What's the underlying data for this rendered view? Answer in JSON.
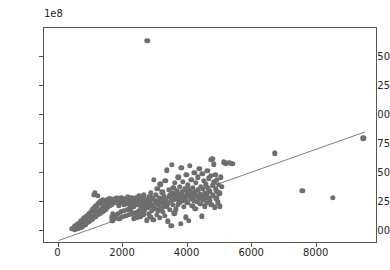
{
  "figure": {
    "width": 390,
    "height": 270,
    "background": "#ffffff",
    "marker_color": "#6e6e6e",
    "line_color": "#707070",
    "axis_color": "#555555",
    "text_color": "#262626"
  },
  "axes": {
    "left": 43,
    "top": 27,
    "width": 334,
    "height": 216,
    "offset_text": "1e8"
  },
  "chart_data": {
    "type": "scatter",
    "title": "",
    "xlabel": "",
    "ylabel": "",
    "y_offset_label": "1e8",
    "y_offset_multiplier": 100000000,
    "xlim": [
      -450,
      9900
    ],
    "ylim": [
      -11000000,
      175000000
    ],
    "grid": false,
    "legend": null,
    "xticks": [
      0,
      2000,
      4000,
      6000,
      8000
    ],
    "xticklabels": [
      "0",
      "2000",
      "4000",
      "6000",
      "8000"
    ],
    "yticks": [
      0,
      25000000,
      50000000,
      75000000,
      100000000,
      125000000,
      150000000
    ],
    "yticklabels": [
      "0.00",
      "0.25",
      "0.50",
      "0.75",
      "1.00",
      "1.25",
      "1.50"
    ],
    "series": [
      {
        "name": "observations",
        "type": "scatter",
        "color": "#6e6e6e",
        "marker": "o",
        "marker_size": 5.4,
        "points": [
          [
            430,
            2100000
          ],
          [
            470,
            3200000
          ],
          [
            500,
            1500000
          ],
          [
            520,
            4300000
          ],
          [
            545,
            2600000
          ],
          [
            560,
            5500000
          ],
          [
            575,
            3400000
          ],
          [
            600,
            1900000
          ],
          [
            615,
            6100000
          ],
          [
            630,
            4000000
          ],
          [
            650,
            2800000
          ],
          [
            665,
            7300000
          ],
          [
            680,
            5000000
          ],
          [
            695,
            3300000
          ],
          [
            710,
            8600000
          ],
          [
            725,
            6200000
          ],
          [
            740,
            4400000
          ],
          [
            755,
            9500000
          ],
          [
            770,
            7000000
          ],
          [
            785,
            5300000
          ],
          [
            800,
            11000000
          ],
          [
            815,
            8200000
          ],
          [
            830,
            6000000
          ],
          [
            845,
            12500000
          ],
          [
            860,
            9000000
          ],
          [
            875,
            7400000
          ],
          [
            890,
            13500000
          ],
          [
            905,
            10500000
          ],
          [
            920,
            8000000
          ],
          [
            935,
            14500000
          ],
          [
            950,
            11500000
          ],
          [
            965,
            9200000
          ],
          [
            980,
            16000000
          ],
          [
            995,
            12000000
          ],
          [
            1010,
            10000000
          ],
          [
            1025,
            17500000
          ],
          [
            1040,
            13200000
          ],
          [
            1055,
            11000000
          ],
          [
            1070,
            19000000
          ],
          [
            1085,
            14000000
          ],
          [
            1100,
            12500000
          ],
          [
            1110,
            31500000
          ],
          [
            1120,
            33000000
          ],
          [
            1130,
            20500000
          ],
          [
            1145,
            15500000
          ],
          [
            1160,
            13000000
          ],
          [
            1175,
            22000000
          ],
          [
            1190,
            16500000
          ],
          [
            1205,
            14000000
          ],
          [
            1220,
            30500000
          ],
          [
            1235,
            23500000
          ],
          [
            1250,
            17500000
          ],
          [
            1265,
            15000000
          ],
          [
            1280,
            25000000
          ],
          [
            1295,
            18500000
          ],
          [
            1310,
            16000000
          ],
          [
            1325,
            26000000
          ],
          [
            1340,
            19500000
          ],
          [
            1355,
            17000000
          ],
          [
            1370,
            27000000
          ],
          [
            1385,
            20500000
          ],
          [
            1400,
            18000000
          ],
          [
            1415,
            24000000
          ],
          [
            1430,
            21500000
          ],
          [
            1445,
            19000000
          ],
          [
            1460,
            25500000
          ],
          [
            1475,
            22500000
          ],
          [
            1490,
            20000000
          ],
          [
            1505,
            26500000
          ],
          [
            1520,
            23000000
          ],
          [
            1535,
            21000000
          ],
          [
            1550,
            27500000
          ],
          [
            1565,
            24000000
          ],
          [
            1580,
            22000000
          ],
          [
            1600,
            28000000
          ],
          [
            1615,
            25000000
          ],
          [
            1630,
            23000000
          ],
          [
            1650,
            12000000
          ],
          [
            1665,
            9000000
          ],
          [
            1680,
            14500000
          ],
          [
            1700,
            26500000
          ],
          [
            1715,
            24500000
          ],
          [
            1730,
            11500000
          ],
          [
            1750,
            27500000
          ],
          [
            1765,
            25500000
          ],
          [
            1780,
            13500000
          ],
          [
            1800,
            28500000
          ],
          [
            1815,
            26000000
          ],
          [
            1830,
            15000000
          ],
          [
            1850,
            24000000
          ],
          [
            1865,
            22000000
          ],
          [
            1880,
            10500000
          ],
          [
            1900,
            27000000
          ],
          [
            1915,
            25000000
          ],
          [
            1930,
            16500000
          ],
          [
            1950,
            29000000
          ],
          [
            1965,
            26500000
          ],
          [
            1980,
            12500000
          ],
          [
            2000,
            24500000
          ],
          [
            2015,
            22500000
          ],
          [
            2030,
            17500000
          ],
          [
            2050,
            28000000
          ],
          [
            2065,
            25500000
          ],
          [
            2080,
            13500000
          ],
          [
            2100,
            26000000
          ],
          [
            2115,
            23500000
          ],
          [
            2130,
            18500000
          ],
          [
            2150,
            29500000
          ],
          [
            2165,
            27000000
          ],
          [
            2180,
            14000000
          ],
          [
            2200,
            25000000
          ],
          [
            2215,
            22000000
          ],
          [
            2230,
            19500000
          ],
          [
            2250,
            28500000
          ],
          [
            2265,
            26000000
          ],
          [
            2280,
            15500000
          ],
          [
            2300,
            24000000
          ],
          [
            2315,
            21000000
          ],
          [
            2330,
            11000000
          ],
          [
            2350,
            27500000
          ],
          [
            2365,
            25000000
          ],
          [
            2380,
            16000000
          ],
          [
            2400,
            29000000
          ],
          [
            2415,
            23000000
          ],
          [
            2430,
            12000000
          ],
          [
            2450,
            26500000
          ],
          [
            2465,
            22500000
          ],
          [
            2480,
            17000000
          ],
          [
            2500,
            30000000
          ],
          [
            2515,
            24500000
          ],
          [
            2530,
            13000000
          ],
          [
            2550,
            28000000
          ],
          [
            2565,
            21500000
          ],
          [
            2580,
            18000000
          ],
          [
            2600,
            25500000
          ],
          [
            2615,
            23500000
          ],
          [
            2630,
            14500000
          ],
          [
            2650,
            31000000
          ],
          [
            2665,
            26500000
          ],
          [
            2680,
            19000000
          ],
          [
            2700,
            24000000
          ],
          [
            2715,
            22000000
          ],
          [
            2730,
            9500000
          ],
          [
            2750,
            164000000
          ],
          [
            2760,
            27000000
          ],
          [
            2775,
            20500000
          ],
          [
            2790,
            15000000
          ],
          [
            2810,
            29500000
          ],
          [
            2825,
            25000000
          ],
          [
            2840,
            12500000
          ],
          [
            2860,
            33000000
          ],
          [
            2875,
            23000000
          ],
          [
            2890,
            17500000
          ],
          [
            2910,
            28500000
          ],
          [
            2925,
            21000000
          ],
          [
            2940,
            10000000
          ],
          [
            2960,
            44500000
          ],
          [
            2975,
            26000000
          ],
          [
            2990,
            19500000
          ],
          [
            3010,
            31500000
          ],
          [
            3025,
            24500000
          ],
          [
            3040,
            14000000
          ],
          [
            3060,
            36500000
          ],
          [
            3075,
            22500000
          ],
          [
            3090,
            18000000
          ],
          [
            3110,
            29000000
          ],
          [
            3125,
            25500000
          ],
          [
            3140,
            11500000
          ],
          [
            3160,
            40500000
          ],
          [
            3175,
            27500000
          ],
          [
            3190,
            20000000
          ],
          [
            3210,
            33500000
          ],
          [
            3225,
            23500000
          ],
          [
            3240,
            16500000
          ],
          [
            3260,
            30500000
          ],
          [
            3275,
            26500000
          ],
          [
            3290,
            13500000
          ],
          [
            3310,
            43500000
          ],
          [
            3325,
            28000000
          ],
          [
            3340,
            21500000
          ],
          [
            3360,
            52500000
          ],
          [
            3375,
            24000000
          ],
          [
            3390,
            8500000
          ],
          [
            3410,
            35500000
          ],
          [
            3425,
            29500000
          ],
          [
            3440,
            18500000
          ],
          [
            3460,
            31000000
          ],
          [
            3475,
            26000000
          ],
          [
            3490,
            4500000
          ],
          [
            3510,
            57000000
          ],
          [
            3525,
            32500000
          ],
          [
            3540,
            22500000
          ],
          [
            3560,
            37500000
          ],
          [
            3575,
            27500000
          ],
          [
            3590,
            15500000
          ],
          [
            3610,
            41500000
          ],
          [
            3625,
            30000000
          ],
          [
            3640,
            19000000
          ],
          [
            3660,
            34500000
          ],
          [
            3675,
            28500000
          ],
          [
            3690,
            23000000
          ],
          [
            3710,
            46500000
          ],
          [
            3725,
            31500000
          ],
          [
            3740,
            25000000
          ],
          [
            3760,
            38500000
          ],
          [
            3775,
            29000000
          ],
          [
            3790,
            6500000
          ],
          [
            3810,
            54500000
          ],
          [
            3825,
            33500000
          ],
          [
            3840,
            26500000
          ],
          [
            3860,
            42500000
          ],
          [
            3875,
            30500000
          ],
          [
            3890,
            21000000
          ],
          [
            3910,
            36000000
          ],
          [
            3925,
            27000000
          ],
          [
            3940,
            12000000
          ],
          [
            3960,
            48500000
          ],
          [
            3975,
            34500000
          ],
          [
            3990,
            24500000
          ],
          [
            4010,
            39500000
          ],
          [
            4025,
            31000000
          ],
          [
            4040,
            9000000
          ],
          [
            4060,
            56500000
          ],
          [
            4075,
            35500000
          ],
          [
            4090,
            28000000
          ],
          [
            4110,
            44500000
          ],
          [
            4125,
            32500000
          ],
          [
            4140,
            22000000
          ],
          [
            4160,
            37500000
          ],
          [
            4175,
            29500000
          ],
          [
            4190,
            26000000
          ],
          [
            4210,
            50500000
          ],
          [
            4225,
            33500000
          ],
          [
            4240,
            19500000
          ],
          [
            4260,
            41500000
          ],
          [
            4275,
            30500000
          ],
          [
            4290,
            25500000
          ],
          [
            4310,
            46500000
          ],
          [
            4325,
            35500000
          ],
          [
            4340,
            28500000
          ],
          [
            4360,
            53500000
          ],
          [
            4375,
            32000000
          ],
          [
            4390,
            23500000
          ],
          [
            4410,
            38500000
          ],
          [
            4425,
            30000000
          ],
          [
            4440,
            13000000
          ],
          [
            4460,
            49500000
          ],
          [
            4475,
            36500000
          ],
          [
            4490,
            27500000
          ],
          [
            4510,
            43500000
          ],
          [
            4525,
            33000000
          ],
          [
            4540,
            21500000
          ],
          [
            4560,
            40500000
          ],
          [
            4575,
            31500000
          ],
          [
            4590,
            24500000
          ],
          [
            4610,
            52000000
          ],
          [
            4625,
            37500000
          ],
          [
            4640,
            29000000
          ],
          [
            4660,
            45500000
          ],
          [
            4675,
            34500000
          ],
          [
            4690,
            26500000
          ],
          [
            4710,
            61500000
          ],
          [
            4725,
            47500000
          ],
          [
            4740,
            22500000
          ],
          [
            4760,
            62500000
          ],
          [
            4775,
            39500000
          ],
          [
            4790,
            31000000
          ],
          [
            4810,
            57500000
          ],
          [
            4825,
            42500000
          ],
          [
            4840,
            20500000
          ],
          [
            4860,
            48500000
          ],
          [
            4875,
            36000000
          ],
          [
            4890,
            28500000
          ],
          [
            4910,
            44500000
          ],
          [
            4925,
            34000000
          ],
          [
            4940,
            25000000
          ],
          [
            4960,
            40000000
          ],
          [
            4980,
            32500000
          ],
          [
            5000,
            21500000
          ],
          [
            5020,
            46500000
          ],
          [
            5060,
            38500000
          ],
          [
            5120,
            59500000
          ],
          [
            5180,
            58500000
          ],
          [
            5290,
            59000000
          ],
          [
            5380,
            58000000
          ],
          [
            6700,
            67000000
          ],
          [
            7550,
            35000000
          ],
          [
            8500,
            29000000
          ],
          [
            9450,
            80000000
          ]
        ]
      },
      {
        "name": "trend-line",
        "type": "line",
        "color": "#707070",
        "linewidth": 0.9,
        "x": [
          0,
          9500
        ],
        "y": [
          -8000000,
          85500000
        ]
      }
    ]
  }
}
